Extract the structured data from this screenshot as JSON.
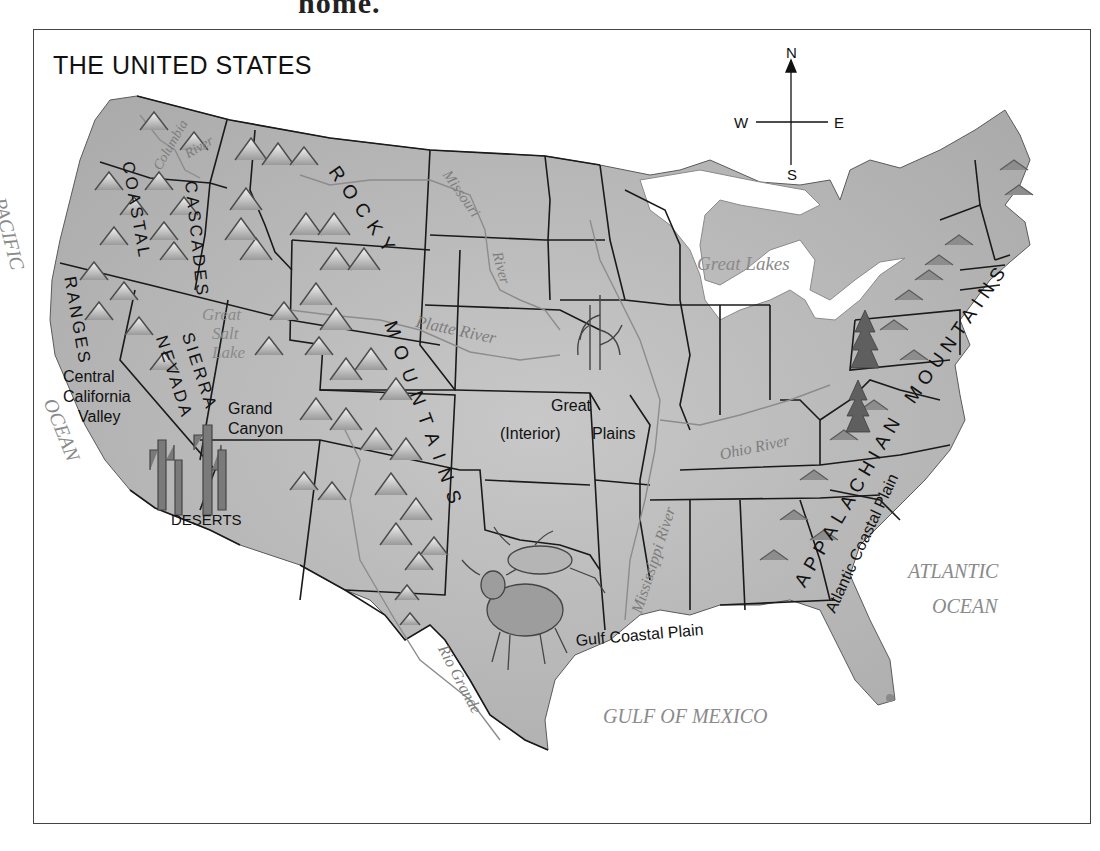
{
  "page": {
    "top_text_fragment": "home."
  },
  "map": {
    "title": "THE UNITED STATES",
    "compass": {
      "north": "N",
      "south": "S",
      "east": "E",
      "west": "W"
    },
    "colors": {
      "land": "#b9b9b9",
      "land_light": "#cfcfcf",
      "water_label": "#8a8a8a",
      "border": "#1a1a1a",
      "frame": "#444444",
      "background": "#ffffff"
    },
    "water_bodies": {
      "pacific": "PACIFIC",
      "pacific_ocean": "OCEAN",
      "atlantic": "ATLANTIC",
      "atlantic_ocean": "OCEAN",
      "gulf": "GULF OF MEXICO",
      "great_lakes": "Great Lakes",
      "great_salt_lake_1": "Great",
      "great_salt_lake_2": "Salt",
      "great_salt_lake_3": "Lake"
    },
    "rivers": {
      "columbia": "Columbia",
      "columbia_river": "River",
      "missouri": "Missouri",
      "missouri_river": "River",
      "platte": "Platte River",
      "mississippi": "Mississippi River",
      "ohio": "Ohio River",
      "rio_grande": "Rio Grande"
    },
    "mountain_ranges": {
      "coastal_1": "COASTAL",
      "coastal_2": "RANGES",
      "cascades": "CASCADES",
      "sierra": "SIERRA",
      "nevada": "NEVADA",
      "rocky": "ROCKY",
      "mountains": "MOUNTAINS",
      "appalachian": "APPALACHIAN",
      "appalachian_mountains": "MOUNTAINS"
    },
    "regions": {
      "central_1": "Central",
      "central_2": "California",
      "central_3": "Valley",
      "grand_1": "Grand",
      "grand_2": "Canyon",
      "deserts": "DESERTS",
      "plains_1": "Great",
      "plains_2": "(Interior)",
      "plains_3": "Plains",
      "gulf_coastal": "Gulf Coastal Plain",
      "atlantic_coastal": "Atlantic Coastal Plain"
    },
    "illustrations": [
      "mountain-peaks",
      "saguaro-cactus",
      "corn-stalk",
      "longhorn-cattle",
      "pine-trees"
    ]
  }
}
